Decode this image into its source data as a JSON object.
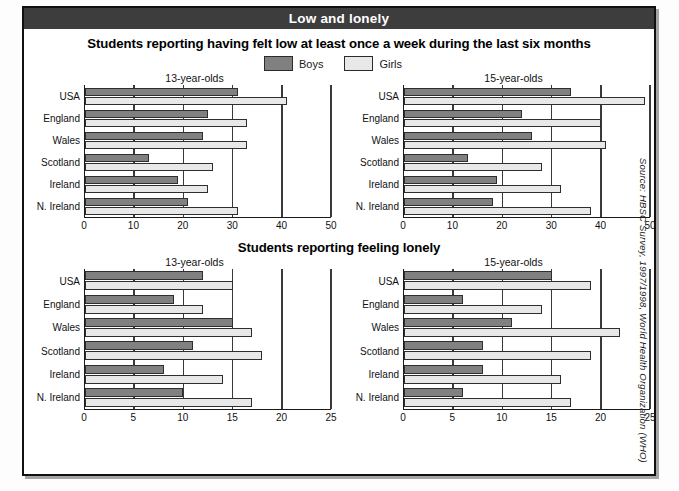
{
  "banner": {
    "title": "Low and lonely"
  },
  "legend": {
    "boys_label": "Boys",
    "girls_label": "Girls",
    "boys_color": "#808080",
    "girls_color": "#e8e8e8"
  },
  "source": {
    "text": "Source: HBSC Survey, 1997/1998, World Health Organization (WHO)"
  },
  "sections": [
    {
      "title": "Students reporting having felt low at least once a week during the last six months"
    },
    {
      "title": "Students reporting feeling lonely"
    }
  ],
  "chart_data": [
    {
      "id": "low-13",
      "type": "bar",
      "orientation": "horizontal",
      "title": "13-year-olds",
      "section": "Students reporting having felt low at least once a week during the last six months",
      "categories": [
        "USA",
        "England",
        "Wales",
        "Scotland",
        "Ireland",
        "N. Ireland"
      ],
      "series": [
        {
          "name": "Boys",
          "color": "#808080",
          "values": [
            31,
            25,
            24,
            13,
            19,
            21
          ]
        },
        {
          "name": "Girls",
          "color": "#e8e8e8",
          "values": [
            41,
            33,
            33,
            26,
            25,
            31
          ]
        }
      ],
      "xlabel": "",
      "ylabel": "",
      "xlim": [
        0,
        50
      ],
      "xticks": [
        0,
        10,
        20,
        30,
        40,
        50
      ],
      "grid": true,
      "legend_position": "top-center"
    },
    {
      "id": "low-15",
      "type": "bar",
      "orientation": "horizontal",
      "title": "15-year-olds",
      "section": "Students reporting having felt low at least once a week during the last six months",
      "categories": [
        "USA",
        "England",
        "Wales",
        "Scotland",
        "Ireland",
        "N. Ireland"
      ],
      "series": [
        {
          "name": "Boys",
          "color": "#808080",
          "values": [
            34,
            24,
            26,
            13,
            19,
            18
          ]
        },
        {
          "name": "Girls",
          "color": "#e8e8e8",
          "values": [
            49,
            40,
            41,
            28,
            32,
            38
          ]
        }
      ],
      "xlabel": "",
      "ylabel": "",
      "xlim": [
        0,
        50
      ],
      "xticks": [
        0,
        10,
        20,
        30,
        40,
        50
      ],
      "grid": true,
      "legend_position": "top-center"
    },
    {
      "id": "lonely-13",
      "type": "bar",
      "orientation": "horizontal",
      "title": "13-year-olds",
      "section": "Students reporting feeling lonely",
      "categories": [
        "USA",
        "England",
        "Wales",
        "Scotland",
        "Ireland",
        "N. Ireland"
      ],
      "series": [
        {
          "name": "Boys",
          "color": "#808080",
          "values": [
            12,
            9,
            15,
            11,
            8,
            10
          ]
        },
        {
          "name": "Girls",
          "color": "#e8e8e8",
          "values": [
            15,
            12,
            17,
            18,
            14,
            17
          ]
        }
      ],
      "xlabel": "",
      "ylabel": "",
      "xlim": [
        0,
        25
      ],
      "xticks": [
        0,
        5,
        10,
        15,
        20,
        25
      ],
      "grid": true,
      "legend_position": "none"
    },
    {
      "id": "lonely-15",
      "type": "bar",
      "orientation": "horizontal",
      "title": "15-year-olds",
      "section": "Students reporting feeling lonely",
      "categories": [
        "USA",
        "England",
        "Wales",
        "Scotland",
        "Ireland",
        "N. Ireland"
      ],
      "series": [
        {
          "name": "Boys",
          "color": "#808080",
          "values": [
            15,
            6,
            11,
            8,
            8,
            6
          ]
        },
        {
          "name": "Girls",
          "color": "#e8e8e8",
          "values": [
            19,
            14,
            22,
            19,
            16,
            17
          ]
        }
      ],
      "xlabel": "",
      "ylabel": "",
      "xlim": [
        0,
        25
      ],
      "xticks": [
        0,
        5,
        10,
        15,
        20,
        25
      ],
      "grid": true,
      "legend_position": "none"
    }
  ]
}
